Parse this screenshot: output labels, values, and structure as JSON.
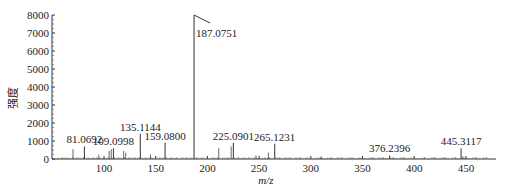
{
  "chart_data": {
    "type": "bar",
    "title": "",
    "xlabel": "m/z",
    "ylabel": "强度",
    "xlim": [
      50,
      475
    ],
    "ylim": [
      0,
      8000
    ],
    "xticks": [
      100,
      150,
      200,
      250,
      300,
      350,
      400,
      450
    ],
    "yticks": [
      0,
      1000,
      2000,
      3000,
      4000,
      5000,
      6000,
      7000,
      8000
    ],
    "grid": false,
    "labeled_peaks": [
      {
        "mz": 81.0692,
        "intensity": 700,
        "label": "81.0692"
      },
      {
        "mz": 109.0998,
        "intensity": 600,
        "label": "109.0998"
      },
      {
        "mz": 135.1144,
        "intensity": 1400,
        "label": "135.1144"
      },
      {
        "mz": 159.08,
        "intensity": 900,
        "label": "159.0800"
      },
      {
        "mz": 187.0751,
        "intensity": 8000,
        "label": "187.0751"
      },
      {
        "mz": 225.0901,
        "intensity": 900,
        "label": "225.0901"
      },
      {
        "mz": 265.1231,
        "intensity": 850,
        "label": "265.1231"
      },
      {
        "mz": 376.2396,
        "intensity": 200,
        "label": "376.2396"
      },
      {
        "mz": 445.3117,
        "intensity": 600,
        "label": "445.3117"
      }
    ],
    "minor_peaks": [
      {
        "mz": 70,
        "intensity": 550
      },
      {
        "mz": 95,
        "intensity": 250
      },
      {
        "mz": 105,
        "intensity": 450
      },
      {
        "mz": 107,
        "intensity": 550
      },
      {
        "mz": 119,
        "intensity": 450
      },
      {
        "mz": 121,
        "intensity": 350
      },
      {
        "mz": 145,
        "intensity": 250
      },
      {
        "mz": 211,
        "intensity": 600
      },
      {
        "mz": 223,
        "intensity": 700
      },
      {
        "mz": 247,
        "intensity": 200
      },
      {
        "mz": 259,
        "intensity": 350
      },
      {
        "mz": 310,
        "intensity": 150
      },
      {
        "mz": 447,
        "intensity": 150
      }
    ]
  }
}
